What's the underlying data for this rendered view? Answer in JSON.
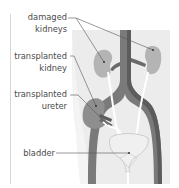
{
  "diagram": {
    "labels": {
      "damaged_kidneys": [
        "damaged",
        "kidneys"
      ],
      "transplanted_kidney": [
        "transplanted",
        "kidney"
      ],
      "transplanted_ureter": [
        "transplanted",
        "ureter"
      ],
      "bladder": [
        "bladder"
      ]
    },
    "colors": {
      "background": "#ffffff",
      "body": "#ebebeb",
      "body_shade": "#e2e2e2",
      "vessel": "#7a7a7a",
      "vessel_dark": "#5c5c5c",
      "damaged_kidney": "#b4b4b4",
      "transplanted_kidney": "#8e8e8e",
      "ureter": "#ffffff",
      "leader_line": "#555555",
      "text": "#4a4a4a"
    }
  }
}
